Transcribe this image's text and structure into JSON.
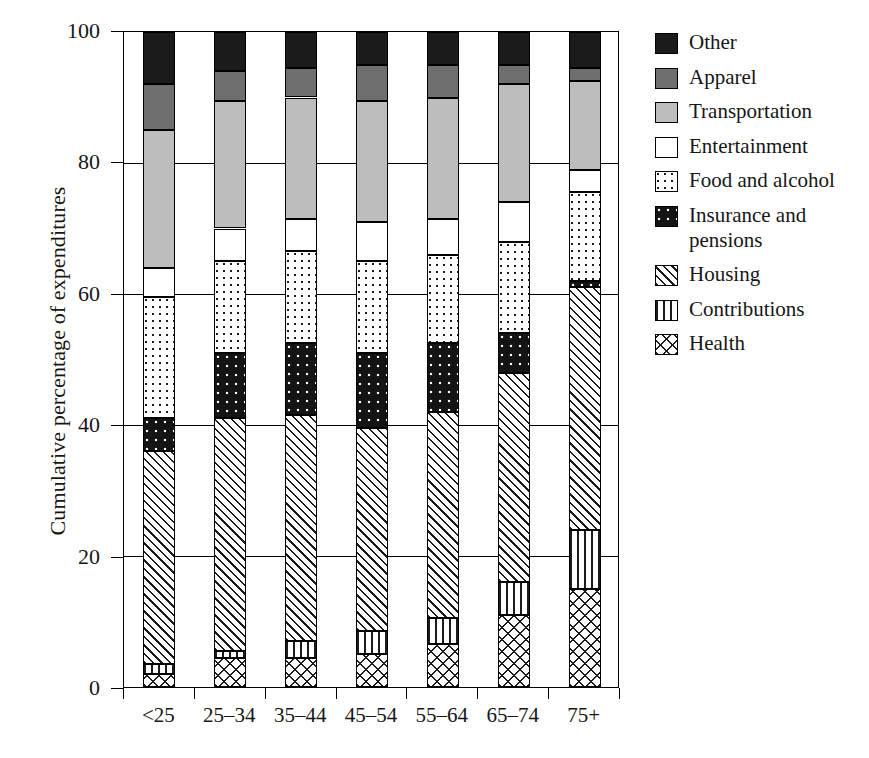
{
  "chart_data": {
    "type": "bar",
    "subtype": "stacked-100-percent",
    "title": "",
    "xlabel": "",
    "ylabel": "Cumulative percentage of expenditures",
    "ylim": [
      0,
      100
    ],
    "yticks": [
      0,
      20,
      40,
      60,
      80,
      100
    ],
    "ytick_labels": [
      "0",
      "20",
      "40",
      "60",
      "80",
      "100"
    ],
    "grid": true,
    "legend_position": "right",
    "categories": [
      "<25",
      "25–34",
      "35–44",
      "45–54",
      "55–64",
      "65–74",
      "75+"
    ],
    "stack_order_bottom_to_top": [
      "Health",
      "Contributions",
      "Housing",
      "Insurance and pensions",
      "Food and alcohol",
      "Entertainment",
      "Transportation",
      "Apparel",
      "Other"
    ],
    "series": [
      {
        "name": "Health",
        "values": [
          2.0,
          4.5,
          4.5,
          5.0,
          6.5,
          11.0,
          15.0
        ]
      },
      {
        "name": "Contributions",
        "values": [
          1.5,
          1.0,
          2.5,
          3.5,
          4.0,
          5.0,
          9.0
        ]
      },
      {
        "name": "Housing",
        "values": [
          32.5,
          35.5,
          34.5,
          31.0,
          31.5,
          32.0,
          37.0
        ]
      },
      {
        "name": "Insurance and pensions",
        "values": [
          5.0,
          10.0,
          11.0,
          11.5,
          10.5,
          6.0,
          1.0
        ]
      },
      {
        "name": "Food and alcohol",
        "values": [
          18.5,
          14.0,
          14.0,
          14.0,
          13.5,
          14.0,
          13.5
        ]
      },
      {
        "name": "Entertainment",
        "values": [
          4.5,
          5.0,
          5.0,
          6.0,
          5.5,
          6.0,
          3.5
        ]
      },
      {
        "name": "Transportation",
        "values": [
          21.0,
          19.5,
          18.5,
          18.5,
          18.5,
          18.0,
          13.5
        ]
      },
      {
        "name": "Apparel",
        "values": [
          7.0,
          4.5,
          4.5,
          5.5,
          5.0,
          3.0,
          2.0
        ]
      },
      {
        "name": "Other",
        "values": [
          8.0,
          6.0,
          5.5,
          5.0,
          5.0,
          5.0,
          5.5
        ]
      }
    ],
    "cumulative_tops": {
      "<25": {
        "Health": 2.0,
        "Contributions": 3.5,
        "Housing": 36.0,
        "Insurance and pensions": 41.0,
        "Food and alcohol": 59.5,
        "Entertainment": 64.0,
        "Transportation": 85.0,
        "Apparel": 92.0,
        "Other": 100.0
      },
      "25–34": {
        "Health": 4.5,
        "Contributions": 5.5,
        "Housing": 41.0,
        "Insurance and pensions": 51.0,
        "Food and alcohol": 65.0,
        "Entertainment": 70.0,
        "Transportation": 89.5,
        "Apparel": 94.0,
        "Other": 100.0
      },
      "35–44": {
        "Health": 4.5,
        "Contributions": 7.0,
        "Housing": 41.5,
        "Insurance and pensions": 52.5,
        "Food and alcohol": 66.5,
        "Entertainment": 71.5,
        "Transportation": 90.0,
        "Apparel": 94.5,
        "Other": 100.0
      },
      "45–54": {
        "Health": 5.0,
        "Contributions": 8.5,
        "Housing": 39.5,
        "Insurance and pensions": 51.0,
        "Food and alcohol": 65.0,
        "Entertainment": 71.0,
        "Transportation": 89.5,
        "Apparel": 95.0,
        "Other": 100.0
      },
      "55–64": {
        "Health": 6.5,
        "Contributions": 10.5,
        "Housing": 42.0,
        "Insurance and pensions": 52.5,
        "Food and alcohol": 66.0,
        "Entertainment": 71.5,
        "Transportation": 90.0,
        "Apparel": 95.0,
        "Other": 100.0
      },
      "65–74": {
        "Health": 11.0,
        "Contributions": 16.0,
        "Housing": 48.0,
        "Insurance and pensions": 54.0,
        "Food and alcohol": 68.0,
        "Entertainment": 74.0,
        "Transportation": 92.0,
        "Apparel": 95.0,
        "Other": 100.0
      },
      "75+": {
        "Health": 15.0,
        "Contributions": 24.0,
        "Housing": 61.0,
        "Insurance and pensions": 62.0,
        "Food and alcohol": 75.5,
        "Entertainment": 79.0,
        "Transportation": 92.5,
        "Apparel": 94.5,
        "Other": 100.0
      }
    }
  },
  "legend": {
    "items": [
      {
        "label": "Other",
        "pattern": "solid-black",
        "swatch_class": "p-other"
      },
      {
        "label": "Apparel",
        "pattern": "solid-dark-gray",
        "swatch_class": "p-apparel"
      },
      {
        "label": "Transportation",
        "pattern": "solid-light-gray",
        "swatch_class": "p-transport"
      },
      {
        "label": "Entertainment",
        "pattern": "solid-white",
        "swatch_class": "p-entertain"
      },
      {
        "label": "Food and alcohol",
        "pattern": "sparse-dots-on-white",
        "swatch_class": "p-food"
      },
      {
        "label": "Insurance and\npensions",
        "pattern": "white-dots-on-black",
        "swatch_class": "p-insurance"
      },
      {
        "label": "Housing",
        "pattern": "diagonal-hatch",
        "swatch_class": "p-housing"
      },
      {
        "label": "Contributions",
        "pattern": "vertical-lines",
        "swatch_class": "p-contrib"
      },
      {
        "label": "Health",
        "pattern": "crosshatch",
        "swatch_class": "p-health"
      }
    ]
  },
  "colors": {
    "other": "#1b1b1b",
    "apparel": "#6e6e6e",
    "transportation": "#bdbdbd",
    "entertainment": "#ffffff",
    "axis": "#000000"
  }
}
